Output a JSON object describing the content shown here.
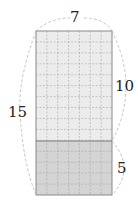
{
  "diagram": {
    "type": "grid-rectangle",
    "columns": 7,
    "rows": 15,
    "top_section_rows": 10,
    "bottom_section_rows": 5,
    "labels": {
      "width": "7",
      "total_height": "15",
      "top_height": "10",
      "bottom_height": "5"
    },
    "colors": {
      "top_fill": "#ececec",
      "bottom_fill": "#d4d4d4",
      "border": "#8a8a8a",
      "grid": "#a8a8a8",
      "brace": "#b5b5b5"
    }
  }
}
